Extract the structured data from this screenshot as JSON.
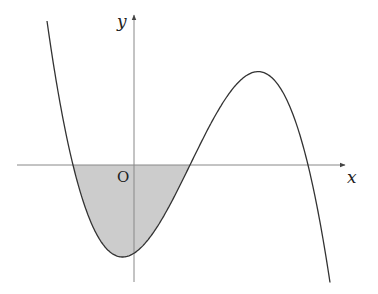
{
  "figure": {
    "type": "function-graph",
    "labels": {
      "x_axis": "x",
      "y_axis": "y",
      "origin": "O"
    },
    "colors": {
      "axis": "#888888",
      "curve": "#333333",
      "shade": "#cccccc",
      "background": "#ffffff"
    },
    "curve": {
      "kind": "cubic",
      "leading_sign": "negative",
      "roots_px": [
        73,
        190,
        308
      ],
      "local_min_px": [
        130,
        257
      ],
      "local_max_px": [
        258,
        75
      ]
    },
    "shaded_region": {
      "from_root_index": 0,
      "to_root_index": 1,
      "position": "below x-axis"
    }
  }
}
